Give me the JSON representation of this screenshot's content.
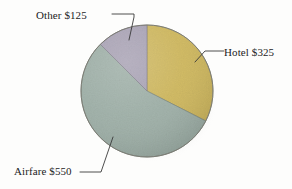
{
  "chart_data": {
    "type": "pie",
    "title": "",
    "subtitle": "",
    "xlabel": "",
    "ylabel": "",
    "legend_position": "none",
    "grid": false,
    "total": 1000,
    "currency": "$",
    "categories": [
      "Hotel",
      "Airfare",
      "Other"
    ],
    "values": [
      325,
      550,
      125
    ],
    "labels": [
      "Hotel $325",
      "Airfare $550",
      "Other $125"
    ],
    "colors": [
      "#cfb85f",
      "#9fb0a8",
      "#a9a3b5"
    ],
    "percentages": [
      32.5,
      55.0,
      12.5
    ],
    "start_angle_deg": 0,
    "direction": "clockwise",
    "slices": [
      {
        "name": "Hotel",
        "label": "Hotel $325",
        "value": 325,
        "percent": 32.5,
        "color": "#cfb85f",
        "start_deg": 0,
        "sweep_deg": 117
      },
      {
        "name": "Airfare",
        "label": "Airfare $550",
        "value": 550,
        "percent": 55.0,
        "color": "#9fb0a8",
        "start_deg": 117,
        "sweep_deg": 198
      },
      {
        "name": "Other",
        "label": "Other $125",
        "value": 125,
        "percent": 12.5,
        "color": "#a9a3b5",
        "start_deg": 315,
        "sweep_deg": 45
      }
    ]
  },
  "figure": {
    "background_color": "#fdfdfc",
    "pie_center_x": 147,
    "pie_center_y": 91,
    "pie_radius": 66,
    "outline_color": "#7d7d75",
    "shadow_color": "#bdbdb8",
    "leader_line_color": "#3a3a3a"
  },
  "labels": {
    "other": "Other $125",
    "hotel": "Hotel $325",
    "airfare": "Airfare $550"
  }
}
